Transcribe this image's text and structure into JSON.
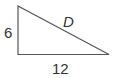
{
  "diagram": {
    "shape": "right-triangle",
    "stroke_color": "#555555",
    "vertices": {
      "top_left": [
        18,
        6
      ],
      "bottom_left": [
        18,
        54
      ],
      "bottom_right": [
        109,
        54
      ]
    },
    "labels": {
      "height": "6",
      "base": "12",
      "hypotenuse": "D"
    }
  }
}
